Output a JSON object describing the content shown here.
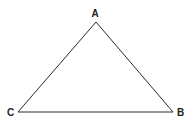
{
  "diagram": {
    "type": "triangle",
    "stroke_color": "#2a2a2a",
    "label_color": "#222222",
    "background": "#ffffff",
    "vertices": [
      {
        "id": "A",
        "label": "A",
        "x": 96,
        "y": 22,
        "label_x": 95,
        "label_y": 17
      },
      {
        "id": "B",
        "label": "B",
        "x": 173,
        "y": 112,
        "label_x": 180.5,
        "label_y": 116
      },
      {
        "id": "C",
        "label": "C",
        "x": 18,
        "y": 112,
        "label_x": 10.5,
        "label_y": 116
      }
    ],
    "edges": [
      {
        "from": "A",
        "to": "B"
      },
      {
        "from": "B",
        "to": "C"
      },
      {
        "from": "C",
        "to": "A"
      }
    ]
  }
}
